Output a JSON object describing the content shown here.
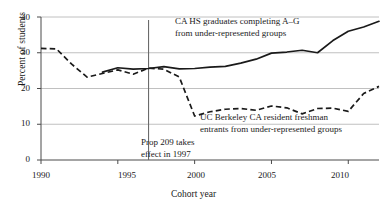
{
  "chart_data": {
    "type": "line",
    "title": "",
    "xlabel": "Cohort year",
    "ylabel": "Percent of students",
    "xlim": [
      1990,
      2012
    ],
    "ylim": [
      0,
      40
    ],
    "xticks": [
      1990,
      1995,
      2000,
      2005,
      2010
    ],
    "yticks": [
      0,
      10,
      20,
      30,
      40
    ],
    "grid": "horizontal",
    "legend_position": "inline-annotations",
    "annotations": [
      {
        "id": "solid-series-label",
        "text_line1": "CA HS graduates completing A–G",
        "text_line2": "from under-represented groups",
        "target_series": "CA HS graduates completing A-G from under-represented groups"
      },
      {
        "id": "dashed-series-label",
        "text_line1": "UC Berkeley CA resident freshman",
        "text_line2": "entrants from under-represented groups",
        "target_series": "UC Berkeley CA resident freshman entrants from under-represented groups"
      },
      {
        "id": "prop209-marker",
        "text_line1": "Prop 209 takes",
        "text_line2": "effect in 1997",
        "vline_x": 1997
      }
    ],
    "x": [
      1990,
      1991,
      1992,
      1993,
      1994,
      1995,
      1996,
      1997,
      1998,
      1999,
      2000,
      2001,
      2002,
      2003,
      2004,
      2005,
      2006,
      2007,
      2008,
      2009,
      2010,
      2011,
      2012
    ],
    "series": [
      {
        "name": "CA HS graduates completing A-G from under-represented groups",
        "style": "solid",
        "color": "#1a1a1a",
        "x": [
          1994,
          1995,
          1996,
          1997,
          1998,
          1999,
          2000,
          2001,
          2002,
          2003,
          2004,
          2005,
          2006,
          2007,
          2008,
          2009,
          2010,
          2011,
          2012
        ],
        "values": [
          24.6,
          25.8,
          25.4,
          25.6,
          26.1,
          25.5,
          25.6,
          26.0,
          26.2,
          27.1,
          28.2,
          29.9,
          30.2,
          30.7,
          30.0,
          33.4,
          36.0,
          37.2,
          38.8
        ]
      },
      {
        "name": "UC Berkeley CA resident freshman entrants from under-represented groups",
        "style": "dashed",
        "color": "#1a1a1a",
        "x": [
          1990,
          1991,
          1992,
          1993,
          1994,
          1995,
          1996,
          1997,
          1998,
          1999,
          2000,
          2001,
          2002,
          2003,
          2004,
          2005,
          2006,
          2007,
          2008,
          2009,
          2010,
          2011,
          2012
        ],
        "values": [
          31.2,
          31.1,
          26.8,
          23.2,
          24.2,
          25.2,
          24.0,
          25.7,
          25.4,
          23.2,
          12.3,
          13.5,
          14.2,
          14.4,
          13.9,
          15.1,
          14.6,
          12.9,
          14.4,
          14.5,
          13.6,
          18.6,
          20.6
        ]
      }
    ],
    "ytick_labels": [
      "0",
      "10",
      "20",
      "30",
      "40"
    ],
    "xtick_labels": [
      "1990",
      "1995",
      "2000",
      "2005",
      "2010"
    ]
  },
  "axes": {
    "y_axis_title": "Percent of students",
    "x_axis_title": "Cohort year"
  }
}
